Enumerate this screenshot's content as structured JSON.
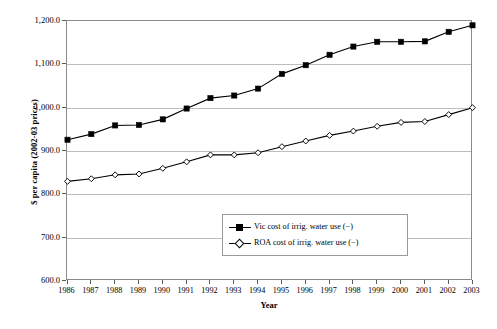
{
  "chart_data": {
    "type": "line",
    "title": "",
    "xlabel": "Year",
    "ylabel": "$ per capita (2002-03 prices)",
    "xlim": [
      1986,
      2003
    ],
    "ylim": [
      600,
      1200
    ],
    "ytick_labels": [
      "1,200.0",
      "1,100.0",
      "1,000.0",
      "900.0",
      "800.0",
      "700.0",
      "600.0"
    ],
    "ytick_values": [
      1200,
      1100,
      1000,
      900,
      800,
      700,
      600
    ],
    "grid": "horizontal",
    "legend_position": "inside-bottom-center",
    "categories": [
      1986,
      1987,
      1988,
      1989,
      1990,
      1991,
      1992,
      1993,
      1994,
      1995,
      1996,
      1997,
      1998,
      1999,
      2000,
      2001,
      2002,
      2003
    ],
    "xtick_labels": [
      "1986",
      "1987",
      "1988",
      "1989",
      "1990",
      "1991",
      "1992",
      "1993",
      "1994",
      "1995",
      "1996",
      "1997",
      "1998",
      "1999",
      "2000",
      "2001",
      "2002",
      "2003"
    ],
    "series": [
      {
        "name": "Vic cost of irrig. water use (−)",
        "marker": "filled-square",
        "color": "#000000",
        "values": [
          926,
          939,
          959,
          960,
          973,
          998,
          1022,
          1028,
          1044,
          1078,
          1098,
          1122,
          1141,
          1152,
          1152,
          1153,
          1175,
          1190
        ]
      },
      {
        "name": "ROA cost of irrig. water use (−)",
        "marker": "open-diamond",
        "color": "#000000",
        "values": [
          830,
          836,
          845,
          847,
          860,
          875,
          891,
          891,
          896,
          910,
          923,
          936,
          946,
          957,
          966,
          968,
          984,
          1000
        ]
      }
    ]
  },
  "legend": {
    "entries": [
      {
        "label": "Vic cost of irrig. water use (−)"
      },
      {
        "label": "ROA cost of irrig. water use (−)"
      }
    ]
  }
}
